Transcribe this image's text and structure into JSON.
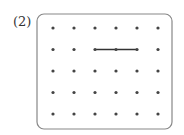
{
  "problem": {
    "label": "(2)"
  },
  "grid": {
    "columns": 6,
    "rows": 5,
    "origin_x": 53,
    "origin_y": 28,
    "spacing_x": 21,
    "spacing_y": 21.5,
    "dot_color": "#444444",
    "border_color": "#888888"
  },
  "segments": [
    {
      "from": {
        "row": 1,
        "col": 2
      },
      "to": {
        "row": 1,
        "col": 4
      },
      "color": "#333333"
    }
  ],
  "marked_points": [
    {
      "row": 1,
      "col": 2
    },
    {
      "row": 1,
      "col": 3
    },
    {
      "row": 1,
      "col": 4
    }
  ]
}
